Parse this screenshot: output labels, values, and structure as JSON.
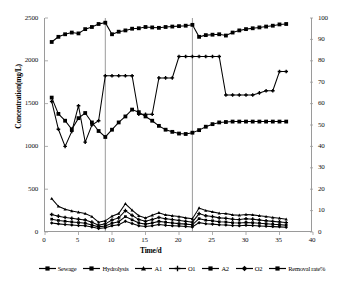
{
  "chart_data": {
    "type": "line",
    "title": "",
    "xlabel": "Time/d",
    "ylabel": "Concentration(mg/L)",
    "y2label": "Removal rate%",
    "xlim": [
      0,
      40
    ],
    "ylim": [
      0,
      2500
    ],
    "y2lim": [
      0,
      100
    ],
    "xticks": [
      0,
      5,
      10,
      15,
      20,
      25,
      30,
      35,
      40
    ],
    "yticks": [
      0,
      500,
      1000,
      1500,
      2000,
      2500
    ],
    "y2ticks": [
      0,
      10,
      20,
      30,
      40,
      50,
      60,
      70,
      80,
      90,
      100
    ],
    "grid": false,
    "legend_position": "bottom",
    "dividers": [
      9,
      22
    ],
    "x": [
      1,
      2,
      3,
      4,
      5,
      6,
      7,
      8,
      9,
      10,
      11,
      12,
      13,
      14,
      15,
      16,
      17,
      18,
      19,
      20,
      21,
      22,
      23,
      24,
      25,
      26,
      27,
      28,
      29,
      30,
      31,
      32,
      33,
      34,
      35,
      36
    ],
    "series": [
      {
        "name": "Sewage",
        "axis": "left",
        "marker": "square",
        "values": [
          2220,
          2280,
          2310,
          2330,
          2320,
          2370,
          2395,
          2430,
          2445,
          2310,
          2340,
          2355,
          2375,
          2380,
          2395,
          2390,
          2385,
          2395,
          2400,
          2405,
          2410,
          2420,
          2280,
          2300,
          2305,
          2310,
          2295,
          2330,
          2355,
          2370,
          2380,
          2390,
          2400,
          2410,
          2425,
          2430
        ]
      },
      {
        "name": "Hydrolysis",
        "axis": "left",
        "marker": "square",
        "values": [
          1570,
          1380,
          1300,
          1200,
          1330,
          1390,
          1280,
          1180,
          1110,
          1195,
          1280,
          1350,
          1430,
          1400,
          1350,
          1300,
          1240,
          1195,
          1170,
          1150,
          1145,
          1160,
          1190,
          1230,
          1260,
          1280,
          1285,
          1290,
          1290,
          1290,
          1290,
          1290,
          1290,
          1290,
          1290,
          1290
        ]
      },
      {
        "name": "A1",
        "axis": "left",
        "marker": "triangle",
        "values": [
          390,
          300,
          265,
          245,
          230,
          215,
          180,
          115,
          130,
          185,
          215,
          330,
          255,
          190,
          165,
          195,
          225,
          200,
          190,
          180,
          165,
          155,
          280,
          250,
          235,
          220,
          215,
          200,
          195,
          205,
          200,
          190,
          180,
          170,
          160,
          150
        ]
      },
      {
        "name": "O1",
        "axis": "left",
        "marker": "plus",
        "values": [
          205,
          185,
          170,
          160,
          150,
          140,
          115,
          80,
          95,
          140,
          165,
          250,
          195,
          145,
          125,
          145,
          170,
          155,
          145,
          135,
          125,
          115,
          215,
          190,
          180,
          165,
          160,
          150,
          145,
          155,
          150,
          140,
          132,
          124,
          118,
          110
        ]
      },
      {
        "name": "A2",
        "axis": "left",
        "marker": "square",
        "values": [
          150,
          135,
          125,
          118,
          110,
          102,
          82,
          60,
          70,
          102,
          120,
          180,
          142,
          106,
          92,
          106,
          124,
          113,
          106,
          98,
          92,
          84,
          156,
          138,
          131,
          120,
          116,
          109,
          105,
          112,
          109,
          102,
          96,
          90,
          86,
          80
        ]
      },
      {
        "name": "O2",
        "axis": "left",
        "marker": "diamond",
        "values": [
          105,
          95,
          88,
          82,
          77,
          72,
          58,
          42,
          49,
          72,
          84,
          126,
          100,
          74,
          64,
          74,
          87,
          79,
          74,
          69,
          64,
          59,
          109,
          97,
          92,
          84,
          81,
          76,
          74,
          78,
          76,
          71,
          67,
          63,
          60,
          56
        ]
      },
      {
        "name": "Removal rate%",
        "axis": "right",
        "marker": "plus",
        "values": [
          61,
          48,
          40,
          47,
          59,
          42,
          50,
          52,
          73,
          73,
          73,
          73,
          73,
          55,
          55,
          55,
          72,
          72,
          72,
          82,
          82,
          82,
          82,
          82,
          82,
          82,
          64,
          64,
          64,
          64,
          64,
          65,
          66,
          66,
          75,
          75
        ]
      }
    ]
  },
  "legend": {
    "items": [
      {
        "label": "Sewage",
        "marker": "square"
      },
      {
        "label": "Hydrolysis",
        "marker": "square"
      },
      {
        "label": "A1",
        "marker": "triangle"
      },
      {
        "label": "O1",
        "marker": "plus"
      },
      {
        "label": "A2",
        "marker": "square"
      },
      {
        "label": "O2",
        "marker": "diamond"
      },
      {
        "label": "Removal rate%",
        "marker": "square"
      }
    ]
  },
  "colors": {
    "series": "#000000",
    "axis": "#9a9a9a",
    "divider": "#8f8f8f",
    "text": "#111111"
  }
}
